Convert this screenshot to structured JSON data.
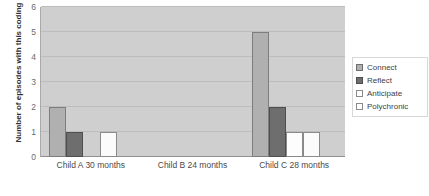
{
  "chart_data": {
    "type": "bar",
    "title": "",
    "xlabel": "",
    "ylabel": "Number of episodes with this coding",
    "ylim": [
      0,
      6
    ],
    "yticks": [
      "6",
      "5",
      "4",
      "3",
      "2",
      "1",
      "0"
    ],
    "grid": true,
    "legend_position": "right",
    "categories": [
      "Child A 30 months",
      "Child B 24 months",
      "Child C 28 months"
    ],
    "series": [
      {
        "name": "Connect",
        "color": "#b0b0b0",
        "values": [
          2,
          0,
          5
        ]
      },
      {
        "name": "Reflect",
        "color": "#6e6e6e",
        "values": [
          1,
          0,
          2
        ]
      },
      {
        "name": "Anticipate",
        "color": "#ffffff",
        "values": [
          0,
          0,
          1
        ]
      },
      {
        "name": "Polychronic",
        "color": "#ffffff",
        "values": [
          1,
          0,
          1
        ]
      }
    ]
  },
  "legend": {
    "items": [
      {
        "label": "Connect"
      },
      {
        "label": "Reflect"
      },
      {
        "label": "Anticipate"
      },
      {
        "label": "Polychronic"
      }
    ]
  },
  "colors": {
    "plot_background": "#cfcfcf",
    "gridline": "#bdbdbd",
    "page_background": "#ffffff"
  }
}
